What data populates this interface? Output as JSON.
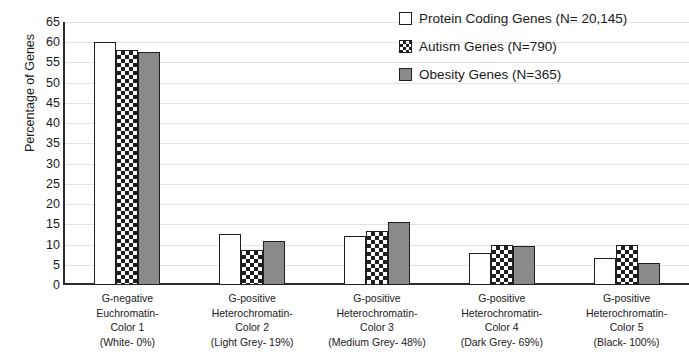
{
  "chart_data": {
    "type": "bar",
    "title": "",
    "xlabel": "",
    "ylabel": "Percentage of Genes",
    "ylim": [
      0,
      65
    ],
    "ytick_step": 5,
    "yticks": [
      0,
      5,
      10,
      15,
      20,
      25,
      30,
      35,
      40,
      45,
      50,
      55,
      60,
      65
    ],
    "grid": true,
    "legend_position": "top-right",
    "categories": [
      "G-negative Euchromatin- Color 1 (White- 0%)",
      "G-positive Heterochromatin- Color 2 (Light Grey- 19%)",
      "G-positive Heterochromatin- Color 3 (Medium Grey- 48%)",
      "G-positive Heterochromatin- Color 4 (Dark Grey- 69%)",
      "G-positive Heterochromatin- Color 5 (Black- 100%)"
    ],
    "category_lines": [
      [
        "G-negative",
        "Euchromatin-",
        "Color 1",
        "(White- 0%)"
      ],
      [
        "G-positive",
        "Heterochromatin-",
        "Color 2",
        "(Light Grey- 19%)"
      ],
      [
        "G-positive",
        "Heterochromatin-",
        "Color 3",
        "(Medium Grey- 48%)"
      ],
      [
        "G-positive",
        "Heterochromatin-",
        "Color 4",
        "(Dark Grey- 69%)"
      ],
      [
        "G-positive",
        "Heterochromatin-",
        "Color 5",
        "(Black- 100%)"
      ]
    ],
    "series": [
      {
        "name": "Protein Coding Genes (N= 20,145)",
        "pattern": "white",
        "values": [
          60,
          12.5,
          12,
          8,
          6.7
        ]
      },
      {
        "name": "Autism Genes (N=790)",
        "pattern": "checker",
        "values": [
          58,
          8.7,
          13.3,
          10,
          10
        ]
      },
      {
        "name": "Obesity Genes (N=365)",
        "pattern": "grey",
        "values": [
          57.7,
          11,
          15.5,
          9.7,
          5.5
        ]
      }
    ],
    "colors": {
      "bar_outline": "#1f1f1f",
      "grey_fill": "#8a8a8a",
      "white_fill": "#ffffff",
      "gridline": "#e2e2e2",
      "axis": "#2b2b2b",
      "text": "#1a1a1a"
    }
  },
  "legend": {
    "items": [
      {
        "label": "Protein Coding Genes (N= 20,145)",
        "pattern": "white"
      },
      {
        "label": "Autism Genes (N=790)",
        "pattern": "checker"
      },
      {
        "label": "Obesity Genes (N=365)",
        "pattern": "grey"
      }
    ]
  }
}
